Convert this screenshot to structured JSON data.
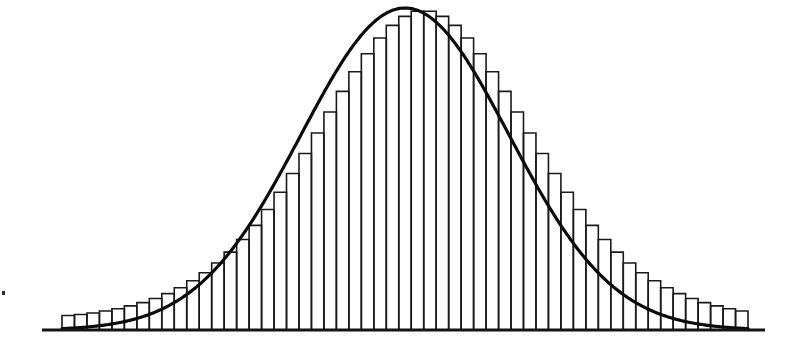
{
  "figure": {
    "width": 801,
    "height": 346,
    "background_color": "#ffffff",
    "ink_color": "#000000"
  },
  "geometry": {
    "baseline_y": 330,
    "baseline_x_start": 42,
    "baseline_x_end": 765,
    "baseline_stroke_width": 3,
    "bars_x_start": 62,
    "bars_x_end": 748,
    "bar_pitch": 12.47,
    "bar_stroke_width": 1.6,
    "curve_stroke_width": 3.2,
    "peak_x": 404,
    "peak_y": 8,
    "curve_left_x": 62,
    "curve_right_x": 748,
    "speck": {
      "x": 2,
      "y": 291,
      "w": 3,
      "h": 4
    }
  },
  "chart_data": {
    "type": "bar",
    "title": "",
    "subtitle": "",
    "xlabel": "",
    "ylabel": "",
    "grid": false,
    "legend": null,
    "annotations": [],
    "axis": {
      "x_axis_visible": true,
      "y_axis_visible": false,
      "x_ticks": [],
      "y_ticks": [],
      "xlim": [
        -3.3,
        3.3
      ],
      "ylim": [
        0,
        1.0
      ]
    },
    "overlay_curve": {
      "name": "normal-density",
      "type": "line",
      "mean": 0.0,
      "sigma": 1.0,
      "peak_value": 1.0,
      "description": "Smooth Gaussian bell curve drawn over the histogram bars"
    },
    "bin_count": 55,
    "categories": [
      "-3.30",
      "-3.18",
      "-3.06",
      "-2.94",
      "-2.82",
      "-2.70",
      "-2.58",
      "-2.46",
      "-2.34",
      "-2.22",
      "-2.10",
      "-1.98",
      "-1.86",
      "-1.74",
      "-1.62",
      "-1.50",
      "-1.38",
      "-1.26",
      "-1.14",
      "-1.02",
      "-0.90",
      "-0.78",
      "-0.66",
      "-0.54",
      "-0.42",
      "-0.30",
      "-0.18",
      "-0.06",
      "0.06",
      "0.18",
      "0.30",
      "0.42",
      "0.54",
      "0.66",
      "0.78",
      "0.90",
      "1.02",
      "1.14",
      "1.26",
      "1.38",
      "1.50",
      "1.62",
      "1.74",
      "1.86",
      "1.98",
      "2.10",
      "2.22",
      "2.34",
      "2.46",
      "2.58",
      "2.70",
      "2.82",
      "2.94",
      "3.06",
      "3.18"
    ],
    "values": [
      0.045,
      0.048,
      0.053,
      0.059,
      0.066,
      0.075,
      0.085,
      0.098,
      0.113,
      0.131,
      0.153,
      0.178,
      0.208,
      0.242,
      0.281,
      0.325,
      0.374,
      0.428,
      0.486,
      0.548,
      0.612,
      0.677,
      0.741,
      0.802,
      0.858,
      0.907,
      0.946,
      0.974,
      0.99,
      0.99,
      0.974,
      0.946,
      0.907,
      0.858,
      0.802,
      0.741,
      0.677,
      0.612,
      0.548,
      0.486,
      0.428,
      0.374,
      0.325,
      0.281,
      0.242,
      0.208,
      0.178,
      0.153,
      0.131,
      0.113,
      0.098,
      0.085,
      0.075,
      0.066,
      0.059
    ]
  }
}
